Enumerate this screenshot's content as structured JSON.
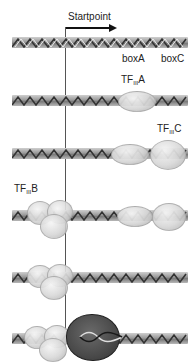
{
  "diagram": {
    "startpoint_label": "Startpoint",
    "box_labels": {
      "boxA": "boxA",
      "boxC": "boxC"
    },
    "factors": {
      "tfiiia": {
        "prefix": "TF",
        "sub": "III",
        "suffix": "A"
      },
      "tfiiic": {
        "prefix": "TF",
        "sub": "III",
        "suffix": "C"
      },
      "tfiiib": {
        "prefix": "TF",
        "sub": "III",
        "suffix": "B"
      }
    },
    "stages": [
      {
        "step": 1,
        "bound": []
      },
      {
        "step": 2,
        "bound": [
          "TFIIIA"
        ]
      },
      {
        "step": 3,
        "bound": [
          "TFIIIA",
          "TFIIIC"
        ]
      },
      {
        "step": 4,
        "bound": [
          "TFIIIB",
          "TFIIIA",
          "TFIIIC"
        ]
      },
      {
        "step": 5,
        "bound": [
          "TFIIIB"
        ]
      },
      {
        "step": 6,
        "bound": [
          "TFIIIB",
          "RNA Polymerase III"
        ]
      }
    ],
    "colors": {
      "dna": "#9a9a9a",
      "factor_blob": "#d8d8d8",
      "pol_iii": "#4a4a4a",
      "line": "#555555",
      "arrow": "#111111"
    }
  }
}
